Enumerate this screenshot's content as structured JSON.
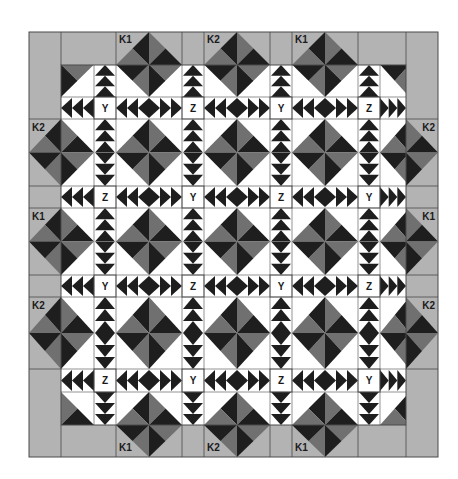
{
  "colors": {
    "dark": "#1e1e1e",
    "medium": "#707070",
    "border": "#b3b3b3",
    "light": "#ffffff",
    "line": "#4a4a4a"
  },
  "grid": {
    "outer": {
      "x0": 29,
      "y0": 32,
      "x1": 438,
      "y1": 457
    },
    "inner": {
      "x0": 61,
      "y0": 65,
      "x1": 406,
      "y1": 425
    },
    "cols": [
      61,
      94,
      116,
      182,
      204,
      270,
      292,
      358,
      380,
      406
    ],
    "rows": [
      65,
      97,
      119,
      186,
      208,
      275,
      297,
      369,
      392,
      425
    ]
  },
  "sashing_labels": [
    [
      "Y",
      "Z",
      "Y",
      "Z"
    ],
    [
      "Z",
      "Y",
      "Z",
      "Y"
    ],
    [
      "Y",
      "Z",
      "Y",
      "Z"
    ],
    [
      "Z",
      "Y",
      "Z",
      "Y"
    ]
  ],
  "border_labels": {
    "top": [
      "K1",
      "K2",
      "K1"
    ],
    "bottom": [
      "K1",
      "K2",
      "K1"
    ],
    "left": [
      "K2",
      "K1",
      "K2"
    ],
    "right": [
      "K2",
      "K1",
      "K2"
    ]
  },
  "legend": {
    "block_types": [
      "Y",
      "Z",
      "K1",
      "K2"
    ]
  }
}
